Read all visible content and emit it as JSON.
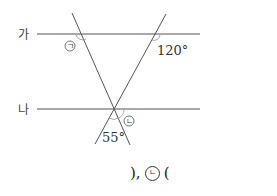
{
  "figure": {
    "lines": {
      "line_ga": {
        "label": "가",
        "y": 34,
        "x1": 37,
        "x2": 200
      },
      "line_na": {
        "label": "나",
        "y": 109,
        "x1": 37,
        "x2": 200
      }
    },
    "transversals": [
      {
        "id": "t1",
        "x1": 72,
        "y1": 13,
        "x2": 130,
        "y2": 145
      },
      {
        "id": "t2",
        "x1": 166,
        "y1": 14,
        "x2": 95,
        "y2": 144
      }
    ],
    "angles": {
      "a": {
        "label": "ㄱ",
        "kind": "unknown"
      },
      "b": {
        "label": "120°",
        "kind": "given"
      },
      "c": {
        "label": "55°",
        "kind": "given"
      },
      "d": {
        "label": "ㄴ",
        "kind": "unknown"
      }
    }
  },
  "answer": {
    "prefix": "),",
    "circled_label": "ㄴ",
    "suffix": "("
  },
  "colors": {
    "line": "#555555",
    "arc": "#9a9a9a",
    "text": "#333333"
  }
}
